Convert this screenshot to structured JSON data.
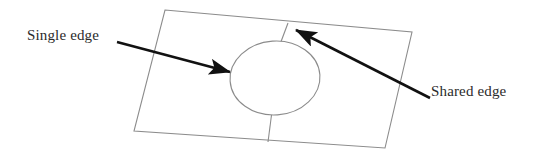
{
  "figure": {
    "background_color": "#ffffff",
    "width": 541,
    "height": 157
  },
  "labels": {
    "single_edge": "Single edge",
    "shared_edge": "Shared edge"
  },
  "colors": {
    "outline": "#8c8c8c",
    "arrow": "#111111",
    "text": "#2b2b2b",
    "background": "#ffffff"
  },
  "geometry": {
    "quad_corners": [
      [
        165,
        10
      ],
      [
        412,
        32
      ],
      [
        385,
        148
      ],
      [
        134,
        131
      ]
    ],
    "divider_top": [
      [
        288,
        23
      ],
      [
        280,
        43
      ]
    ],
    "divider_bottom": [
      [
        272,
        115
      ],
      [
        268,
        142
      ]
    ],
    "ellipse": {
      "cx": 275,
      "cy": 78,
      "rx": 45,
      "ry": 37,
      "rotation": -4
    },
    "arrow_single_edge": {
      "from": [
        117,
        42
      ],
      "to": [
        236,
        73
      ]
    },
    "arrow_shared_edge": {
      "from": [
        430,
        98
      ],
      "to": [
        290,
        27
      ]
    }
  }
}
